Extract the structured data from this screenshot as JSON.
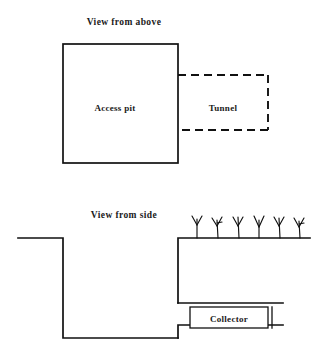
{
  "figure": {
    "title_above": "View from above",
    "title_side": "View from side",
    "labels": {
      "access_pit": "Access pit",
      "tunnel": "Tunnel",
      "collector": "Collector"
    },
    "colors": {
      "ink": "#111111",
      "background": "#ffffff"
    }
  },
  "view_above": {
    "caption": "View from above",
    "access_pit": {
      "label": "Access pit",
      "line_style": "solid",
      "x": 63,
      "y": 44,
      "width": 115,
      "height": 119,
      "label_x": 115,
      "label_y": 108
    },
    "tunnel": {
      "label": "Tunnel",
      "line_style": "dashed",
      "x": 178,
      "y": 75,
      "width": 90,
      "height": 55,
      "label_x": 223,
      "label_y": 108
    },
    "caption_x": 124,
    "caption_y": 25
  },
  "view_side": {
    "caption": "View from side",
    "caption_x": 124,
    "caption_y": 218,
    "ground_left": {
      "x_start": 18,
      "x_end": 63,
      "y": 238
    },
    "ground_right": {
      "x_start": 178,
      "x_end": 310,
      "y": 238
    },
    "pit": {
      "left_wall_x": 63,
      "right_wall_x": 178,
      "top_y": 238,
      "floor_y": 338
    },
    "tunnel_opening": {
      "ceiling_y": 303,
      "x_start": 178,
      "x_end": 283,
      "step_x": 178,
      "step_y_top": 325,
      "step_y_bottom": 338
    },
    "collector": {
      "label": "Collector",
      "x": 190,
      "y": 307,
      "width": 78,
      "height": 21,
      "label_x": 229,
      "label_y": 321,
      "outer_x": 183,
      "outer_y": 303,
      "outer_width": 100,
      "outer_height": 29
    },
    "plants": {
      "count": 6,
      "baseline_y": 238,
      "positions": [
        197,
        218,
        239,
        259,
        280,
        300
      ],
      "height": 22,
      "description": "grass-tuft"
    }
  }
}
